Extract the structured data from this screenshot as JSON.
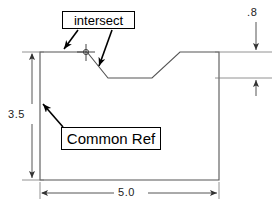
{
  "drawing": {
    "title": "Engineering part outline with notch",
    "background_color": "#ffffff",
    "line_color": "#555555",
    "annotation_color": "#000000",
    "callouts": [
      {
        "id": "intersect",
        "label": "intersect",
        "leaders": 2,
        "marker": "crosshair-marker"
      },
      {
        "id": "common-ref",
        "label": "Common Ref",
        "leaders": 1,
        "marker": "none"
      }
    ],
    "dimensions": [
      {
        "id": "height",
        "value": "3.5",
        "orientation": "vertical",
        "position": "left"
      },
      {
        "id": "width",
        "value": "5.0",
        "orientation": "horizontal",
        "position": "bottom"
      },
      {
        "id": "depth",
        "value": ".8",
        "orientation": "vertical",
        "position": "right"
      }
    ]
  }
}
